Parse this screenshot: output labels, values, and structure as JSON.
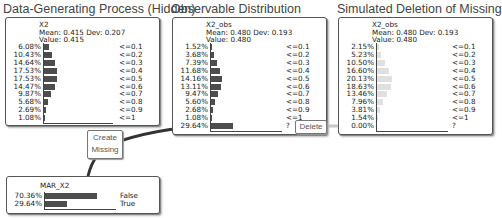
{
  "titles": {
    "hidden": "Data-Generating Process (Hidden)",
    "observable": "Observable Distribution",
    "simulated": "Simulated Deletion of Missing"
  },
  "nodes": {
    "x2": {
      "name": "X2",
      "stats": "Mean: 0.415 Dev: 0.207",
      "value": "Value: 0.415",
      "rows": [
        {
          "pct": "6.08%",
          "label": "<=0.1",
          "v": 6.08
        },
        {
          "pct": "10.43%",
          "label": "<=0.2",
          "v": 10.43
        },
        {
          "pct": "14.64%",
          "label": "<=0.3",
          "v": 14.64
        },
        {
          "pct": "17.53%",
          "label": "<=0.4",
          "v": 17.53
        },
        {
          "pct": "17.53%",
          "label": "<=0.5",
          "v": 17.53
        },
        {
          "pct": "14.47%",
          "label": "<=0.6",
          "v": 14.47
        },
        {
          "pct": "9.87%",
          "label": "<=0.7",
          "v": 9.87
        },
        {
          "pct": "5.68%",
          "label": "<=0.8",
          "v": 5.68
        },
        {
          "pct": "2.69%",
          "label": "<=0.9",
          "v": 2.69
        },
        {
          "pct": "1.08%",
          "label": "<=1",
          "v": 1.08
        }
      ]
    },
    "x2_obs": {
      "name": "X2_obs",
      "stats": "Mean: 0.480 Dev: 0.193",
      "value": "Value: 0.480",
      "rows": [
        {
          "pct": "1.52%",
          "label": "<=0.1",
          "v": 1.52
        },
        {
          "pct": "3.68%",
          "label": "<=0.2",
          "v": 3.68
        },
        {
          "pct": "7.39%",
          "label": "<=0.3",
          "v": 7.39
        },
        {
          "pct": "11.68%",
          "label": "<=0.4",
          "v": 11.68
        },
        {
          "pct": "14.16%",
          "label": "<=0.5",
          "v": 14.16
        },
        {
          "pct": "13.11%",
          "label": "<=0.6",
          "v": 13.11
        },
        {
          "pct": "9.47%",
          "label": "<=0.7",
          "v": 9.47
        },
        {
          "pct": "5.60%",
          "label": "<=0.8",
          "v": 5.6
        },
        {
          "pct": "2.68%",
          "label": "<=0.9",
          "v": 2.68
        },
        {
          "pct": "1.08%",
          "label": "<=1",
          "v": 1.08
        },
        {
          "pct": "29.64%",
          "label": "?",
          "v": 29.64
        }
      ]
    },
    "x2_obs_deleted": {
      "name": "X2_obs",
      "stats": "Mean: 0.480 Dev: 0.193",
      "value": "Value: 0.480",
      "rows": [
        {
          "pct": "2.15%",
          "label": "<=0.1",
          "v": 2.15
        },
        {
          "pct": "5.23%",
          "label": "<=0.2",
          "v": 5.23
        },
        {
          "pct": "10.50%",
          "label": "<=0.3",
          "v": 10.5
        },
        {
          "pct": "16.60%",
          "label": "<=0.4",
          "v": 16.6
        },
        {
          "pct": "20.13%",
          "label": "<=0.5",
          "v": 20.13
        },
        {
          "pct": "18.63%",
          "label": "<=0.6",
          "v": 18.63
        },
        {
          "pct": "13.46%",
          "label": "<=0.7",
          "v": 13.46
        },
        {
          "pct": "7.96%",
          "label": "<=0.8",
          "v": 7.96
        },
        {
          "pct": "3.81%",
          "label": "<=0.9",
          "v": 3.81
        },
        {
          "pct": "1.54%",
          "label": "<=1",
          "v": 1.54
        },
        {
          "pct": "0.00%",
          "label": "?",
          "v": 0.0
        }
      ]
    },
    "mar_x2": {
      "name": "MAR_X2",
      "rows": [
        {
          "pct": "70.36%",
          "label": "False",
          "v": 70.36
        },
        {
          "pct": "29.64%",
          "label": "True",
          "v": 29.64
        }
      ]
    }
  },
  "callouts": {
    "create_missing": [
      "Create",
      "Missing"
    ],
    "delete": "Delete"
  },
  "colors": {
    "bar_dark": "#4d4d4d",
    "bar_light": "#e0e0e0",
    "arrow_dark": "#333333",
    "arrow_light": "#c8c8c8"
  }
}
